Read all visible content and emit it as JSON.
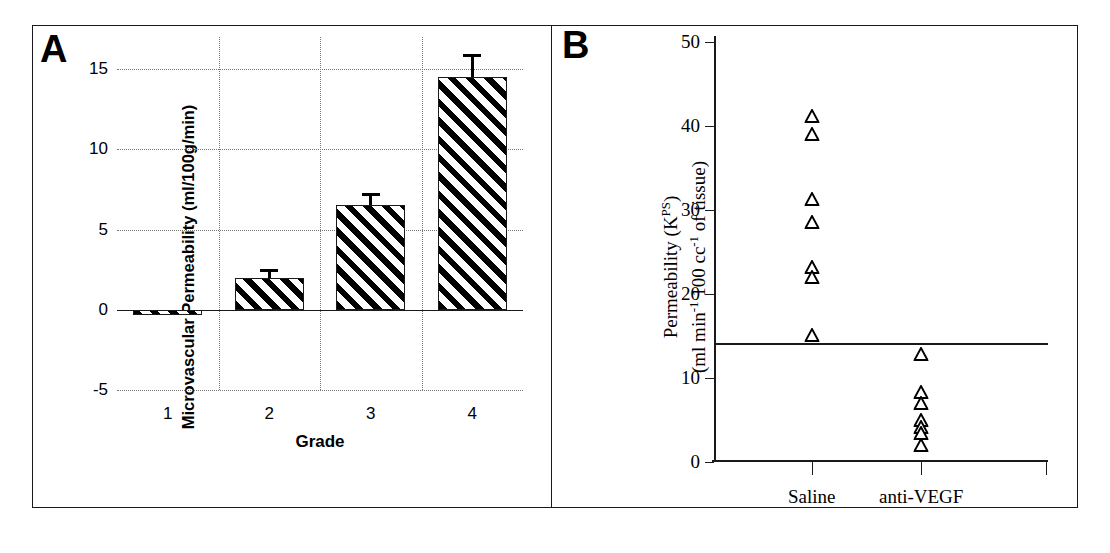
{
  "figure": {
    "panel_a_letter": "A",
    "panel_b_letter": "B",
    "background_color": "#ffffff",
    "ink_color": "#1a1a1a"
  },
  "chart_data": [
    {
      "type": "bar",
      "panel": "A",
      "title": "",
      "xlabel": "Grade",
      "ylabel": "Microvascular Permeability (ml/100g/min)",
      "categories": [
        "1",
        "2",
        "3",
        "4"
      ],
      "values": [
        -0.3,
        2.0,
        6.5,
        14.5
      ],
      "errors": [
        0.0,
        0.55,
        0.8,
        1.45
      ],
      "ylim": [
        -5,
        17
      ],
      "yticks": [
        -5,
        0,
        5,
        10,
        15
      ],
      "ytick_labels": [
        "-5",
        "0",
        "5",
        "10",
        "15"
      ],
      "grid": "dotted",
      "legend": "none",
      "bar_fill": "diagonal-hatch",
      "bar_edge_color": "#1a1a1a"
    },
    {
      "type": "scatter",
      "panel": "B",
      "title": "",
      "xlabel": "",
      "ylabel_line1": "Permeability (K",
      "ylabel_line1_sup": "PS",
      "ylabel_line1_end": ")",
      "ylabel_line2_a": "(ml min",
      "ylabel_line2_sup1": "-1",
      "ylabel_line2_b": " 100 cc",
      "ylabel_line2_sup2": "-1",
      "ylabel_line2_c": " of tissue)",
      "ylim": [
        0,
        50
      ],
      "yticks": [
        0,
        10,
        20,
        30,
        40,
        50
      ],
      "ytick_labels": [
        "0",
        "10",
        "20",
        "30",
        "40",
        "50"
      ],
      "groups": [
        "Saline",
        "anti-VEGF"
      ],
      "threshold_line_value": 14.2,
      "marker": "open-triangle",
      "series": [
        {
          "name": "Saline",
          "x_category": "Saline",
          "values": [
            41.2,
            39.0,
            31.3,
            28.6,
            23.2,
            22.0,
            15.1
          ]
        },
        {
          "name": "anti-VEGF",
          "x_category": "anti-VEGF",
          "values": [
            12.9,
            8.3,
            7.0,
            5.0,
            4.2,
            3.4,
            2.0
          ]
        }
      ],
      "grid": "off",
      "legend": "none"
    }
  ]
}
